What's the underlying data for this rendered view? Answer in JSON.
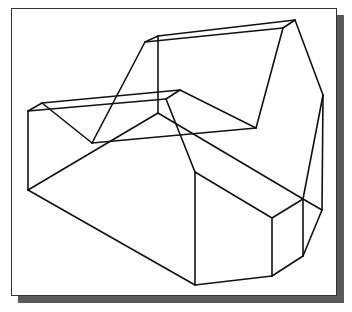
{
  "figure": {
    "type": "3d-wireframe-drawing",
    "colors": {
      "background": "#ffffff",
      "frame_border": "#333333",
      "shadow": "#5a5a5a",
      "stroke": "#111111"
    },
    "vertices": {
      "A": [
        28,
        111
      ],
      "B": [
        42,
        103
      ],
      "C": [
        180,
        90
      ],
      "D": [
        166,
        99
      ],
      "E": [
        145,
        42
      ],
      "F": [
        158,
        36
      ],
      "G": [
        295,
        20
      ],
      "H": [
        283,
        28
      ],
      "I": [
        158,
        113
      ],
      "J": [
        92,
        143
      ],
      "K": [
        256,
        128
      ],
      "L": [
        28,
        190
      ],
      "M": [
        195,
        172
      ],
      "N": [
        195,
        285
      ],
      "O": [
        272,
        218
      ],
      "P": [
        272,
        276
      ],
      "Q": [
        303,
        199
      ],
      "R": [
        303,
        256
      ],
      "S": [
        323,
        95
      ],
      "T": [
        322,
        210
      ]
    },
    "edges": [
      [
        "A",
        "B"
      ],
      [
        "B",
        "C"
      ],
      [
        "A",
        "D"
      ],
      [
        "C",
        "D"
      ],
      [
        "A",
        "L"
      ],
      [
        "B",
        "J"
      ],
      [
        "J",
        "K"
      ],
      [
        "C",
        "K"
      ],
      [
        "K",
        "H"
      ],
      [
        "E",
        "F"
      ],
      [
        "F",
        "G"
      ],
      [
        "E",
        "H"
      ],
      [
        "G",
        "H"
      ],
      [
        "F",
        "I"
      ],
      [
        "E",
        "J"
      ],
      [
        "I",
        "L"
      ],
      [
        "I",
        "Q"
      ],
      [
        "D",
        "M"
      ],
      [
        "G",
        "S"
      ],
      [
        "S",
        "T"
      ],
      [
        "S",
        "Q"
      ],
      [
        "L",
        "N"
      ],
      [
        "M",
        "N"
      ],
      [
        "M",
        "O"
      ],
      [
        "O",
        "P"
      ],
      [
        "N",
        "P"
      ],
      [
        "O",
        "Q"
      ],
      [
        "Q",
        "R"
      ],
      [
        "P",
        "R"
      ],
      [
        "R",
        "T"
      ],
      [
        "Q",
        "T"
      ]
    ]
  }
}
